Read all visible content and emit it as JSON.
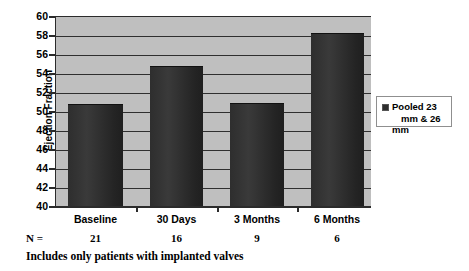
{
  "chart_data": {
    "type": "bar",
    "title": "",
    "xlabel": "",
    "ylabel": "Ejection Fraction",
    "categories": [
      "Baseline",
      "30 Days",
      "3 Months",
      "6 Months"
    ],
    "values": [
      50.8,
      54.9,
      51.0,
      58.3
    ],
    "series": [
      {
        "name": "Pooled 23 mm & 26 mm",
        "values": [
          50.8,
          54.9,
          51.0,
          58.3
        ]
      }
    ],
    "ylim": [
      40,
      60
    ],
    "yticks": [
      40,
      42,
      44,
      46,
      48,
      50,
      52,
      54,
      56,
      58,
      60
    ],
    "ytick_labels": [
      "40",
      "42",
      "44",
      "46",
      "48",
      "50",
      "52",
      "54",
      "56",
      "58",
      "60"
    ],
    "grid": true,
    "grid_axis": "y",
    "legend_position": "right",
    "legend_entries": [
      "Pooled 23 mm & 26 mm"
    ],
    "plot_background_color": "#bfbfbf",
    "bar_color": "#2e2e2e",
    "annotations": {
      "n_label": "N =",
      "n_values": [
        "21",
        "16",
        "9",
        "6"
      ],
      "footnote": "Includes only patients with implanted valves"
    }
  },
  "legend": {
    "line1": "Pooled 23",
    "line2": "mm & 26 mm",
    "swatch_color": "#2e2e2e"
  }
}
